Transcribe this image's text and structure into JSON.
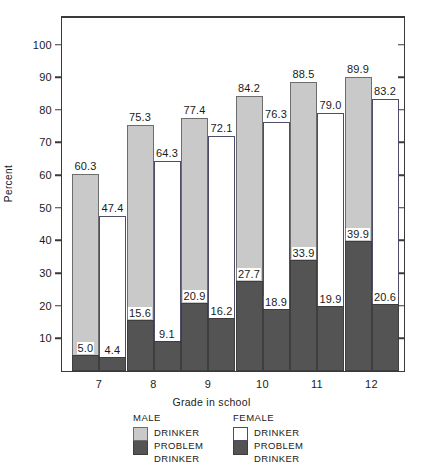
{
  "chart_data": {
    "type": "bar",
    "title": "",
    "xlabel": "Grade in school",
    "ylabel": "Percent",
    "categories": [
      "7",
      "8",
      "9",
      "10",
      "11",
      "12"
    ],
    "ylim": [
      0,
      105
    ],
    "yticks": [
      10,
      20,
      30,
      40,
      50,
      60,
      70,
      80,
      90,
      100
    ],
    "grid": false,
    "legend_position": "bottom",
    "series": [
      {
        "name": "MALE DRINKER",
        "group": "MALE",
        "label": "DRINKER",
        "color": "#c9c9c9",
        "values": [
          60.3,
          75.3,
          77.4,
          84.2,
          88.5,
          89.9
        ]
      },
      {
        "name": "MALE PROBLEM DRINKER",
        "group": "MALE",
        "label": "PROBLEM DRINKER",
        "color": "#545454",
        "values": [
          5.0,
          15.6,
          20.9,
          27.7,
          33.9,
          39.9
        ]
      },
      {
        "name": "FEMALE DRINKER",
        "group": "FEMALE",
        "label": "DRINKER",
        "color": "#ffffff",
        "values": [
          47.4,
          64.3,
          72.1,
          76.3,
          79.0,
          83.2
        ]
      },
      {
        "name": "FEMALE PROBLEM DRINKER",
        "group": "FEMALE",
        "label": "PROBLEM DRINKER",
        "color": "#545454",
        "values": [
          4.4,
          9.1,
          16.2,
          18.9,
          19.9,
          20.6
        ]
      }
    ]
  },
  "axes": {
    "y_title": "Percent",
    "x_title": "Grade in school",
    "y_tick_labels": [
      "100",
      "90",
      "80",
      "70",
      "60",
      "50",
      "40",
      "30",
      "20",
      "10"
    ],
    "x_tick_labels": [
      "7",
      "8",
      "9",
      "10",
      "11",
      "12"
    ]
  },
  "legend": {
    "male": {
      "heading": "MALE",
      "drinker_label": "DRINKER",
      "problem_line1": "PROBLEM",
      "problem_line2": "DRINKER"
    },
    "female": {
      "heading": "FEMALE",
      "drinker_label": "DRINKER",
      "problem_line1": "PROBLEM",
      "problem_line2": "DRINKER"
    }
  },
  "colors": {
    "male_drinker": "#c9c9c9",
    "problem_drinker": "#545454",
    "female_drinker": "#ffffff",
    "axis": "#3a3a3a"
  }
}
